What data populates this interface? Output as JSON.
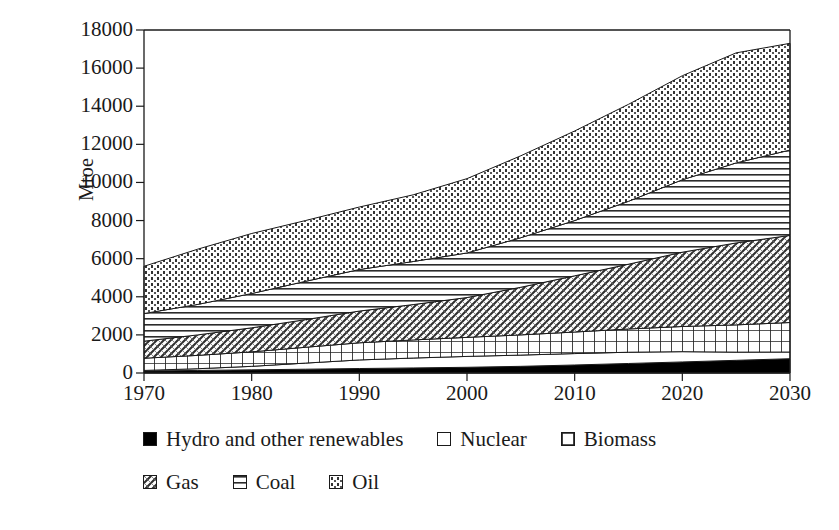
{
  "chart_data": {
    "type": "area",
    "stacked": true,
    "title": "",
    "subtitle": "",
    "xlabel": "",
    "ylabel": "Mtoe",
    "xlim": [
      1970,
      2030
    ],
    "ylim": [
      0,
      18000
    ],
    "ytick_step": 2000,
    "xtick_step": 10,
    "grid": false,
    "legend_position": "bottom",
    "x": [
      1970,
      1975,
      1980,
      1985,
      1990,
      1995,
      2000,
      2005,
      2010,
      2015,
      2020,
      2025,
      2030
    ],
    "xticks": [
      "1970",
      "1980",
      "1990",
      "2000",
      "2010",
      "2020",
      "2030"
    ],
    "yticks": [
      "0",
      "2000",
      "4000",
      "6000",
      "8000",
      "10000",
      "12000",
      "14000",
      "16000",
      "18000"
    ],
    "series": [
      {
        "name": "Hydro and other renewables",
        "pattern": "solid-black",
        "values": [
          105,
          135,
          165,
          200,
          235,
          265,
          300,
          350,
          420,
          500,
          580,
          665,
          750
        ]
      },
      {
        "name": "Nuclear",
        "pattern": "empty-white",
        "values": [
          30,
          90,
          185,
          320,
          450,
          520,
          570,
          590,
          600,
          590,
          540,
          430,
          350
        ]
      },
      {
        "name": "Biomass",
        "pattern": "grid",
        "values": [
          640,
          700,
          760,
          830,
          900,
          950,
          1000,
          1060,
          1130,
          1220,
          1320,
          1430,
          1550
        ]
      },
      {
        "name": "Gas",
        "pattern": "diagonal-crosshatch",
        "values": [
          895,
          1075,
          1260,
          1450,
          1665,
          1855,
          2090,
          2500,
          2950,
          3400,
          3900,
          4300,
          4570
        ]
      },
      {
        "name": "Coal",
        "pattern": "horizontal-lines",
        "values": [
          1450,
          1600,
          1800,
          2010,
          2180,
          2260,
          2340,
          2600,
          2900,
          3300,
          3800,
          4200,
          4480
        ]
      },
      {
        "name": "Oil",
        "pattern": "dotted-fine",
        "values": [
          2480,
          2900,
          3150,
          3190,
          3280,
          3500,
          3900,
          4300,
          4700,
          5090,
          5460,
          5775,
          5600
        ]
      }
    ],
    "stack_totals": [
      5600,
      6500,
      7320,
      8000,
      8710,
      9350,
      10200,
      11400,
      12700,
      14100,
      15600,
      16800,
      17300
    ],
    "legend_rows": [
      [
        {
          "label": "Hydro and other renewables",
          "swatch": "solid-black"
        },
        {
          "label": "Nuclear",
          "swatch": "empty-white"
        },
        {
          "label": "Biomass",
          "swatch": "grid"
        }
      ],
      [
        {
          "label": "Gas",
          "swatch": "diagonal-crosshatch"
        },
        {
          "label": "Coal",
          "swatch": "horizontal-lines"
        },
        {
          "label": "Oil",
          "swatch": "dotted-fine"
        }
      ]
    ]
  },
  "colors": {
    "axis": "#1a1a1a",
    "text": "#1a1a1a",
    "background": "#ffffff",
    "fill_black": "#000000",
    "fill_white": "#ffffff",
    "pattern_stroke": "#262626"
  }
}
